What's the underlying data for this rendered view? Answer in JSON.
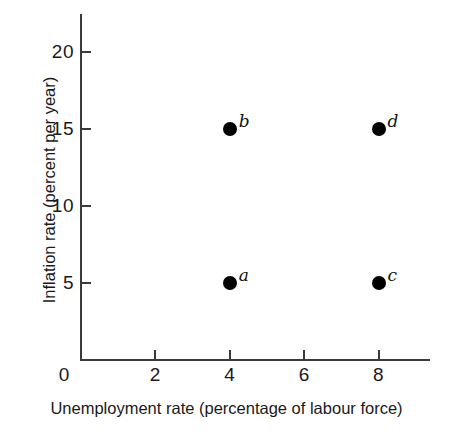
{
  "chart_data": {
    "type": "scatter",
    "title": "",
    "xlabel": "Unemployment rate (percentage of labour force)",
    "ylabel": "Inflation rate (percent per year)",
    "xlim": [
      0,
      9.4
    ],
    "ylim": [
      0,
      22.5
    ],
    "xticks": [
      2,
      4,
      6,
      8
    ],
    "xtick_labels": [
      "2",
      "4",
      "6",
      "8"
    ],
    "yticks": [
      5,
      10,
      15,
      20
    ],
    "ytick_labels": [
      "5",
      "10",
      "15",
      "20"
    ],
    "origin_label": "0",
    "grid": false,
    "legend": "none",
    "marker_color": "#000000",
    "axis_color": "#3a3a3a",
    "background": "#ffffff",
    "points": [
      {
        "label": "a",
        "x": 4,
        "y": 5
      },
      {
        "label": "b",
        "x": 4,
        "y": 15
      },
      {
        "label": "c",
        "x": 8,
        "y": 5
      },
      {
        "label": "d",
        "x": 8,
        "y": 15
      }
    ]
  },
  "geometry": {
    "plot_left": 81,
    "plot_right": 430,
    "plot_bottom": 360,
    "plot_top": 14,
    "x_px_per_unit": 37.2,
    "y_px_per_unit": 15.4
  }
}
